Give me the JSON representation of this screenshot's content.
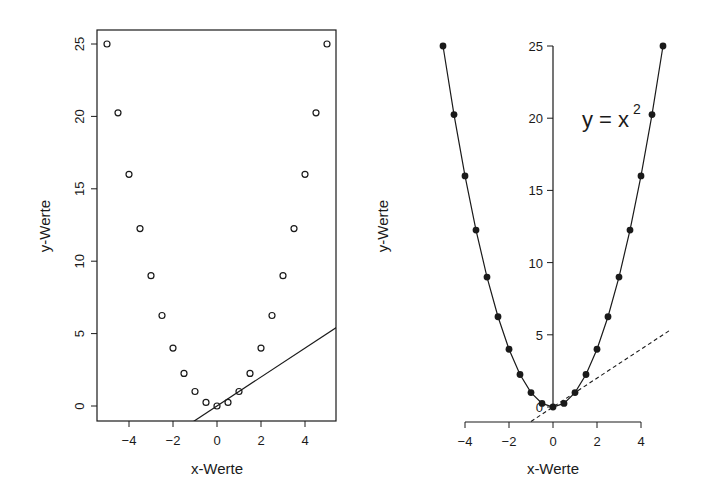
{
  "chart_data": [
    {
      "id": "left",
      "type": "scatter",
      "title": "",
      "xlabel": "x-Werte",
      "ylabel": "y-Werte",
      "xlim": [
        -5.3,
        5.3
      ],
      "ylim": [
        -1,
        26
      ],
      "x_ticks": [
        -4,
        -2,
        0,
        2,
        4
      ],
      "x_tick_labels": [
        "−4",
        "−2",
        "0",
        "2",
        "4"
      ],
      "y_ticks": [
        0,
        5,
        10,
        15,
        20,
        25
      ],
      "y_tick_labels": [
        "0",
        "5",
        "10",
        "15",
        "20",
        "25"
      ],
      "grid": false,
      "box": true,
      "marker": "open-circle",
      "series": [
        {
          "name": "points",
          "x": [
            -5,
            -4.5,
            -4,
            -3.5,
            -3,
            -2.5,
            -2,
            -1.5,
            -1,
            -0.5,
            0,
            0.5,
            1,
            1.5,
            2,
            2.5,
            3,
            3.5,
            4,
            4.5,
            5
          ],
          "y": [
            25,
            20.25,
            16,
            12.25,
            9,
            6.25,
            4,
            2.25,
            1,
            0.25,
            0,
            0.25,
            1,
            2.25,
            4,
            6.25,
            9,
            12.25,
            16,
            20.25,
            25
          ]
        }
      ],
      "lines": [
        {
          "name": "line y = x",
          "intercept": 0,
          "slope": 1,
          "style": "solid"
        }
      ]
    },
    {
      "id": "right",
      "type": "line",
      "title": "",
      "xlabel": "x-Werte",
      "ylabel": "y-Werte",
      "xlim": [
        -5.3,
        5.3
      ],
      "ylim": [
        -1,
        26
      ],
      "x_ticks": [
        -4,
        -2,
        0,
        2,
        4
      ],
      "x_tick_labels": [
        "−4",
        "−2",
        "0",
        "2",
        "4"
      ],
      "y_ticks": [
        0,
        5,
        10,
        15,
        20,
        25
      ],
      "y_tick_labels": [
        "0",
        "5",
        "10",
        "15",
        "20",
        "25"
      ],
      "grid": false,
      "box": false,
      "y_axis_at_x": 0,
      "marker": "filled-circle",
      "annotation": {
        "text": "y = x",
        "superscript": "2",
        "x": 3,
        "y": 20
      },
      "series": [
        {
          "name": "y = x^2",
          "x": [
            -5,
            -4.5,
            -4,
            -3.5,
            -3,
            -2.5,
            -2,
            -1.5,
            -1,
            -0.5,
            0,
            0.5,
            1,
            1.5,
            2,
            2.5,
            3,
            3.5,
            4,
            4.5,
            5
          ],
          "y": [
            25,
            20.25,
            16,
            12.25,
            9,
            6.25,
            4,
            2.25,
            1,
            0.25,
            0,
            0.25,
            1,
            2.25,
            4,
            6.25,
            9,
            12.25,
            16,
            20.25,
            25
          ]
        }
      ],
      "lines": [
        {
          "name": "line y = x",
          "intercept": 0,
          "slope": 1,
          "style": "dashed"
        }
      ]
    }
  ]
}
